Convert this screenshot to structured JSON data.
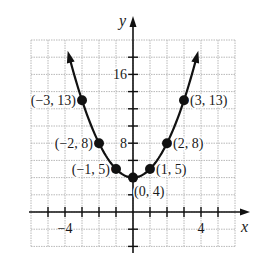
{
  "chart_data": {
    "type": "line",
    "title": "",
    "xlabel": "x",
    "ylabel": "y",
    "xlim": [
      -6,
      6
    ],
    "ylim": [
      -4,
      20
    ],
    "grid": true,
    "grid_step_x": 1,
    "grid_step_y": 2,
    "x_tick_labels": [
      {
        "value": -4,
        "label": "−4"
      },
      {
        "value": 4,
        "label": "4"
      }
    ],
    "y_tick_labels": [
      {
        "value": 8,
        "label": "8"
      },
      {
        "value": 16,
        "label": "16"
      }
    ],
    "series": [
      {
        "name": "y = x^2 + 4",
        "curve": "parabola",
        "arrows_both_ends": true,
        "color": "#111111",
        "points": [
          {
            "x": -3,
            "y": 13,
            "label": "(−3, 13)",
            "label_pos": "left"
          },
          {
            "x": -2,
            "y": 8,
            "label": "(−2, 8)",
            "label_pos": "left"
          },
          {
            "x": -1,
            "y": 5,
            "label": "(−1, 5)",
            "label_pos": "left"
          },
          {
            "x": 0,
            "y": 4,
            "label": "(0, 4)",
            "label_pos": "below-right"
          },
          {
            "x": 1,
            "y": 5,
            "label": "(1, 5)",
            "label_pos": "right"
          },
          {
            "x": 2,
            "y": 8,
            "label": "(2, 8)",
            "label_pos": "right"
          },
          {
            "x": 3,
            "y": 13,
            "label": "(3, 13)",
            "label_pos": "right"
          }
        ]
      }
    ]
  }
}
